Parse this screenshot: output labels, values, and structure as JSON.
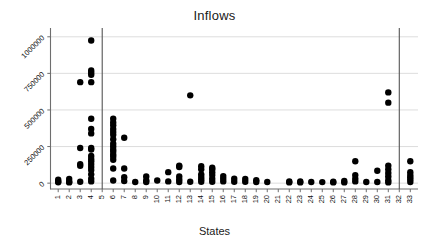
{
  "chart_data": {
    "type": "scatter",
    "title": "Inflows",
    "xlabel": "States",
    "ylabel": "",
    "grid": true,
    "grid_axis": "y",
    "legend": false,
    "xlim": [
      0.3,
      33.7
    ],
    "ylim": [
      -40000,
      1060000
    ],
    "ytick_values": [
      0,
      250000,
      500000,
      750000,
      1000000
    ],
    "ytick_labels": [
      "0",
      "250000",
      "500000",
      "750000",
      "1000000"
    ],
    "ytick_rotation": 45,
    "xtick_rotation": 90,
    "categories": [
      "1",
      "2",
      "3",
      "4",
      "5",
      "6",
      "7",
      "8",
      "9",
      "10",
      "11",
      "12",
      "13",
      "14",
      "15",
      "16",
      "17",
      "18",
      "19",
      "20",
      "21",
      "22",
      "23",
      "24",
      "25",
      "26",
      "27",
      "28",
      "29",
      "30",
      "31",
      "32",
      "33"
    ],
    "vertical_reference_lines": [
      5,
      32
    ],
    "marker": "circle",
    "marker_color": "#000000",
    "marker_size": 4.2,
    "series": [
      {
        "name": "Inflows",
        "points": [
          {
            "x": 1,
            "y": 12000
          },
          {
            "x": 1,
            "y": 24000
          },
          {
            "x": 1,
            "y": 6000
          },
          {
            "x": 2,
            "y": 10000
          },
          {
            "x": 2,
            "y": 28000
          },
          {
            "x": 2,
            "y": 5000
          },
          {
            "x": 3,
            "y": 690000
          },
          {
            "x": 3,
            "y": 240000
          },
          {
            "x": 3,
            "y": 130000
          },
          {
            "x": 3,
            "y": 118000
          },
          {
            "x": 3,
            "y": 10000
          },
          {
            "x": 4,
            "y": 975000
          },
          {
            "x": 4,
            "y": 770000
          },
          {
            "x": 4,
            "y": 755000
          },
          {
            "x": 4,
            "y": 740000
          },
          {
            "x": 4,
            "y": 690000
          },
          {
            "x": 4,
            "y": 440000
          },
          {
            "x": 4,
            "y": 370000
          },
          {
            "x": 4,
            "y": 340000
          },
          {
            "x": 4,
            "y": 240000
          },
          {
            "x": 4,
            "y": 230000
          },
          {
            "x": 4,
            "y": 185000
          },
          {
            "x": 4,
            "y": 165000
          },
          {
            "x": 4,
            "y": 150000
          },
          {
            "x": 4,
            "y": 130000
          },
          {
            "x": 4,
            "y": 110000
          },
          {
            "x": 4,
            "y": 90000
          },
          {
            "x": 4,
            "y": 60000
          },
          {
            "x": 4,
            "y": 30000
          },
          {
            "x": 4,
            "y": 12000
          },
          {
            "x": 6,
            "y": 440000
          },
          {
            "x": 6,
            "y": 415000
          },
          {
            "x": 6,
            "y": 395000
          },
          {
            "x": 6,
            "y": 370000
          },
          {
            "x": 6,
            "y": 350000
          },
          {
            "x": 6,
            "y": 330000
          },
          {
            "x": 6,
            "y": 300000
          },
          {
            "x": 6,
            "y": 270000
          },
          {
            "x": 6,
            "y": 250000
          },
          {
            "x": 6,
            "y": 230000
          },
          {
            "x": 6,
            "y": 215000
          },
          {
            "x": 6,
            "y": 195000
          },
          {
            "x": 6,
            "y": 180000
          },
          {
            "x": 6,
            "y": 160000
          },
          {
            "x": 6,
            "y": 100000
          },
          {
            "x": 6,
            "y": 18000
          },
          {
            "x": 7,
            "y": 310000
          },
          {
            "x": 7,
            "y": 100000
          },
          {
            "x": 7,
            "y": 40000
          },
          {
            "x": 7,
            "y": 15000
          },
          {
            "x": 8,
            "y": 8000
          },
          {
            "x": 9,
            "y": 45000
          },
          {
            "x": 9,
            "y": 18000
          },
          {
            "x": 9,
            "y": 8000
          },
          {
            "x": 10,
            "y": 18000
          },
          {
            "x": 11,
            "y": 75000
          },
          {
            "x": 11,
            "y": 12000
          },
          {
            "x": 12,
            "y": 120000
          },
          {
            "x": 12,
            "y": 110000
          },
          {
            "x": 12,
            "y": 45000
          },
          {
            "x": 12,
            "y": 25000
          },
          {
            "x": 12,
            "y": 8000
          },
          {
            "x": 13,
            "y": 600000
          },
          {
            "x": 13,
            "y": 10000
          },
          {
            "x": 14,
            "y": 115000
          },
          {
            "x": 14,
            "y": 95000
          },
          {
            "x": 14,
            "y": 60000
          },
          {
            "x": 14,
            "y": 42000
          },
          {
            "x": 14,
            "y": 25000
          },
          {
            "x": 14,
            "y": 10000
          },
          {
            "x": 15,
            "y": 105000
          },
          {
            "x": 15,
            "y": 95000
          },
          {
            "x": 15,
            "y": 75000
          },
          {
            "x": 15,
            "y": 55000
          },
          {
            "x": 15,
            "y": 30000
          },
          {
            "x": 15,
            "y": 10000
          },
          {
            "x": 16,
            "y": 48000
          },
          {
            "x": 16,
            "y": 30000
          },
          {
            "x": 16,
            "y": 12000
          },
          {
            "x": 17,
            "y": 30000
          },
          {
            "x": 17,
            "y": 10000
          },
          {
            "x": 18,
            "y": 28000
          },
          {
            "x": 18,
            "y": 10000
          },
          {
            "x": 19,
            "y": 20000
          },
          {
            "x": 19,
            "y": 8000
          },
          {
            "x": 20,
            "y": 8000
          },
          {
            "x": 22,
            "y": 12000
          },
          {
            "x": 22,
            "y": 5000
          },
          {
            "x": 23,
            "y": 12000
          },
          {
            "x": 23,
            "y": 5000
          },
          {
            "x": 24,
            "y": 8000
          },
          {
            "x": 25,
            "y": 7000
          },
          {
            "x": 26,
            "y": 10000
          },
          {
            "x": 26,
            "y": 5000
          },
          {
            "x": 27,
            "y": 15000
          },
          {
            "x": 27,
            "y": 5000
          },
          {
            "x": 28,
            "y": 150000
          },
          {
            "x": 28,
            "y": 55000
          },
          {
            "x": 28,
            "y": 30000
          },
          {
            "x": 28,
            "y": 12000
          },
          {
            "x": 29,
            "y": 8000
          },
          {
            "x": 30,
            "y": 85000
          },
          {
            "x": 30,
            "y": 8000
          },
          {
            "x": 31,
            "y": 620000
          },
          {
            "x": 31,
            "y": 550000
          },
          {
            "x": 31,
            "y": 120000
          },
          {
            "x": 31,
            "y": 95000
          },
          {
            "x": 31,
            "y": 70000
          },
          {
            "x": 31,
            "y": 45000
          },
          {
            "x": 31,
            "y": 20000
          },
          {
            "x": 31,
            "y": 5000
          },
          {
            "x": 33,
            "y": 150000
          },
          {
            "x": 33,
            "y": 75000
          },
          {
            "x": 33,
            "y": 55000
          },
          {
            "x": 33,
            "y": 40000
          },
          {
            "x": 33,
            "y": 25000
          },
          {
            "x": 33,
            "y": 8000
          }
        ]
      }
    ]
  },
  "colors": {
    "marker": "#000000",
    "gridline": "#d9d9d9",
    "axis": "#6e6e6e",
    "reference_line": "#555555",
    "text": "#1a1a1a",
    "background": "#ffffff"
  }
}
